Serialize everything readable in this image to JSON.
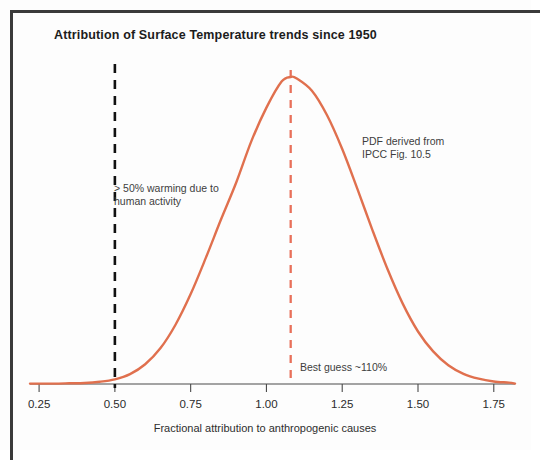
{
  "figure": {
    "title": "Attribution of Surface Temperature trends since 1950",
    "x_axis_label": "Fractional attribution to anthropogenic causes",
    "annotations": {
      "threshold": "> 50% warming due to\nhuman activity",
      "source": "PDF derived from\nIPCC Fig. 10.5",
      "best_guess": "Best guess ~110%"
    },
    "colors": {
      "curve": "#e0704e",
      "best_guess_line": "#e8705a",
      "threshold_line": "#111111",
      "axis": "#4a4a4a",
      "title": "#1c1c1c",
      "frame": "#3a3a3a"
    }
  },
  "chart_data": {
    "type": "line",
    "title": "Attribution of Surface Temperature trends since 1950",
    "subtitle": "",
    "xlabel": "Fractional attribution to anthropogenic causes",
    "ylabel": "",
    "xlim": [
      0.22,
      1.82
    ],
    "ylim": [
      0,
      1.05
    ],
    "grid": false,
    "legend": null,
    "tick_labels": [
      "0.25",
      "0.50",
      "0.75",
      "1.00",
      "1.25",
      "1.50",
      "1.75"
    ],
    "ticks": [
      0.25,
      0.5,
      0.75,
      1.0,
      1.25,
      1.5,
      1.75
    ],
    "series": [
      {
        "name": "PDF of fractional attribution",
        "description": "Probability density function, approximately Gaussian, peak near 1.08",
        "peak_x": 1.08,
        "sigma": 0.2,
        "x": [
          0.25,
          0.3,
          0.35,
          0.4,
          0.45,
          0.5,
          0.55,
          0.6,
          0.65,
          0.7,
          0.75,
          0.8,
          0.85,
          0.9,
          0.95,
          1.0,
          1.05,
          1.08,
          1.1,
          1.15,
          1.2,
          1.25,
          1.3,
          1.35,
          1.4,
          1.45,
          1.5,
          1.55,
          1.6,
          1.65,
          1.7,
          1.75,
          1.8
        ],
        "y": [
          0.0,
          0.0,
          0.001,
          0.002,
          0.006,
          0.014,
          0.031,
          0.063,
          0.115,
          0.192,
          0.292,
          0.41,
          0.535,
          0.655,
          0.79,
          0.9,
          0.985,
          1.0,
          0.995,
          0.955,
          0.875,
          0.765,
          0.635,
          0.5,
          0.372,
          0.26,
          0.17,
          0.105,
          0.06,
          0.032,
          0.016,
          0.007,
          0.003
        ]
      }
    ],
    "reference_lines": [
      {
        "name": "threshold-50-percent",
        "x": 0.5,
        "style": "dashed",
        "color": "#111111",
        "label": "> 50% warming due to human activity"
      },
      {
        "name": "best-guess",
        "x": 1.08,
        "style": "dashed",
        "color": "#e8705a",
        "label": "Best guess ~110%"
      }
    ],
    "annotations": [
      {
        "name": "threshold-note",
        "text": "> 50% warming due to human activity",
        "x": 0.52,
        "y": 0.65
      },
      {
        "name": "source-note",
        "text": "PDF derived from IPCC Fig. 10.5",
        "x": 1.33,
        "y": 0.8
      },
      {
        "name": "best-guess-note",
        "text": "Best guess ~110%",
        "x": 1.13,
        "y": 0.06
      }
    ]
  }
}
